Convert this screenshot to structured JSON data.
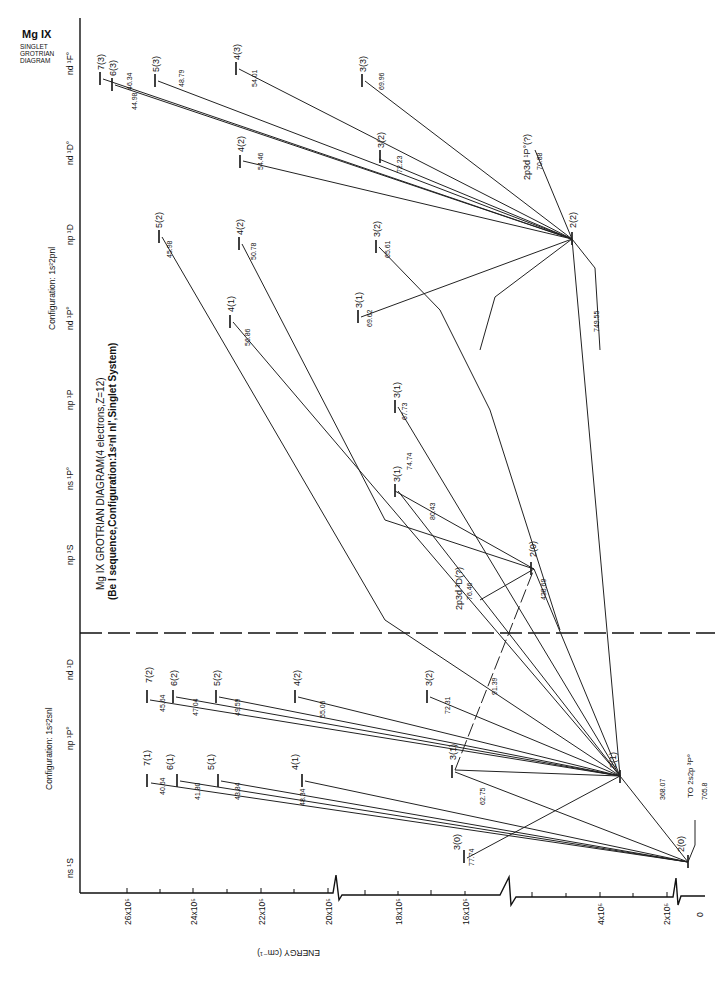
{
  "header": {
    "ion": "Mg IX",
    "subtitle_lines": [
      "SINGLET",
      "GROTRIAN",
      "DIAGRAM"
    ],
    "title": "Mg IX GROTRIAN DIAGRAM(4 electrons,Z=12)",
    "subtitle": "(Be I sequence,Configuration:1s²nl nl',Singlet System)"
  },
  "configurations": [
    {
      "label": "Configuration: 1s²2snl",
      "columns": [
        "ns ¹S",
        "np ¹P°",
        "nd ¹D"
      ]
    },
    {
      "label": "Configuration: 1s²2pnl",
      "columns": [
        "np ¹S",
        "ns ¹P°",
        "np ¹P",
        "nd ¹P°",
        "np ¹D",
        "nd ¹D°",
        "nd ¹F°"
      ]
    }
  ],
  "axis": {
    "label": "ENERGY (cm⁻¹)",
    "ticks": [
      "0",
      "2x10⁵",
      "4x10⁵",
      "16x10⁵",
      "18x10⁵",
      "20x10⁵",
      "22x10⁵",
      "24x10⁵",
      "26x10⁵"
    ]
  },
  "levels": [
    {
      "id": "2(0)",
      "column": "ns 1S",
      "label": "2(0)"
    },
    {
      "id": "3(0)",
      "column": "ns 1S",
      "label": "3(0)"
    },
    {
      "id": "2(1)",
      "column": "np 1P°",
      "label": "2(1)"
    },
    {
      "id": "3(1)a",
      "column": "np 1P°",
      "label": "3(1)"
    },
    {
      "id": "4(1)a",
      "column": "np 1P°",
      "label": "4(1)"
    },
    {
      "id": "5(1)a",
      "column": "np 1P°",
      "label": "5(1)"
    },
    {
      "id": "6(1)a",
      "column": "np 1P°",
      "label": "6(1)"
    },
    {
      "id": "7(1)a",
      "column": "np 1P°",
      "label": "7(1)"
    },
    {
      "id": "3(2)a",
      "column": "nd 1D",
      "label": "3(2)"
    },
    {
      "id": "4(2)a",
      "column": "nd 1D",
      "label": "4(2)"
    },
    {
      "id": "5(2)a",
      "column": "nd 1D",
      "label": "5(2)"
    },
    {
      "id": "6(2)a",
      "column": "nd 1D",
      "label": "6(2)"
    },
    {
      "id": "7(2)a",
      "column": "nd 1D",
      "label": "7(2)"
    },
    {
      "id": "2(0)b",
      "column": "np 1S",
      "label": "2(0)"
    },
    {
      "id": "3(1)b",
      "column": "ns 1P°",
      "label": "3(1)"
    },
    {
      "id": "3(1)c",
      "column": "np 1P",
      "label": "3(1)"
    },
    {
      "id": "3(1)d",
      "column": "nd 1P°",
      "label": "3(1)"
    },
    {
      "id": "4(1)d",
      "column": "nd 1P°",
      "label": "4(1)"
    },
    {
      "id": "2(2)",
      "column": "np 1D",
      "label": "2(2)"
    },
    {
      "id": "3(2)e",
      "column": "np 1D",
      "label": "3(2)"
    },
    {
      "id": "4(2)e",
      "column": "np 1D",
      "label": "4(2)"
    },
    {
      "id": "5(2)e",
      "column": "np 1D",
      "label": "5(2)"
    },
    {
      "id": "3(2)f",
      "column": "nd 1D°",
      "label": "3(2)"
    },
    {
      "id": "4(2)f",
      "column": "nd 1D°",
      "label": "4(2)"
    },
    {
      "id": "3(3)",
      "column": "nd 1F°",
      "label": "3(3)"
    },
    {
      "id": "4(3)",
      "column": "nd 1F°",
      "label": "4(3)"
    },
    {
      "id": "5(3)",
      "column": "nd 1F°",
      "label": "5(3)"
    },
    {
      "id": "6(3)",
      "column": "nd 1F°",
      "label": "6(3)"
    },
    {
      "id": "7(3)",
      "column": "nd 1F°",
      "label": "7(3)"
    }
  ],
  "wavelengths": {
    "w7774": "77.74",
    "w6275": "62.75",
    "w4834": "48.34",
    "w4384": "43.84",
    "w4180": "41.80",
    "w4064": "40.64",
    "w7231": "72.31",
    "w5506": "55.06",
    "w4959": "49.59",
    "w4704": "47.04",
    "w4564": "45.64",
    "w36807": "368.07",
    "w7058": "705.8",
    "w9139": "91.39",
    "w43869": "438.69",
    "w7646": "76.46",
    "w8043": "80.43",
    "w7474": "74.74",
    "w6773": "67.73",
    "w6962": "69.62",
    "w5686": "56.86",
    "w6561": "65.61",
    "w5078": "50.78",
    "w4598": "45.98",
    "w74955": "749.55",
    "w7088": "70.88",
    "w7223": "72.23",
    "w5446": "54.46",
    "w6996": "69.96",
    "w5401": "54.01",
    "w4879": "48.79",
    "w4634": "46.34",
    "w4498": "44.98"
  },
  "annotations": {
    "to_triplet": "TO 2s2p ³P°",
    "perturber1": "2p3d ³D(?)",
    "perturber2": "2p3d ¹P°(?)"
  }
}
